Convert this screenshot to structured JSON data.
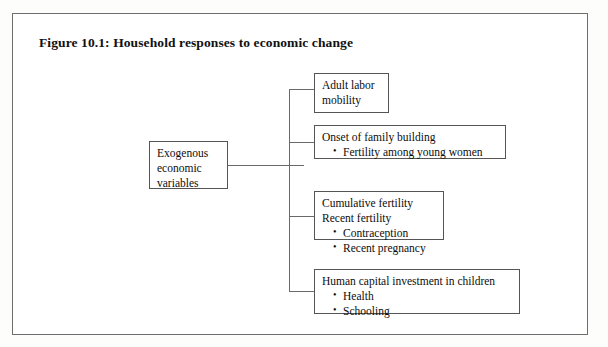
{
  "figure": {
    "title": "Figure 10.1: Household responses to economic change"
  },
  "diagram": {
    "type": "tree",
    "root": {
      "label": "Exogenous\neconomic\nvariables"
    },
    "branches": [
      {
        "id": "adult-labor-mobility",
        "head": "Adult labor\nmobility",
        "bullets": []
      },
      {
        "id": "onset-of-family-building",
        "head": "Onset of family building",
        "bullets": [
          "Fertility among young women"
        ]
      },
      {
        "id": "cumulative-and-recent-fertility",
        "head": "Cumulative fertility\nRecent fertility",
        "bullets": [
          "Contraception",
          "Recent pregnancy"
        ]
      },
      {
        "id": "human-capital-investment",
        "head": "Human capital investment in children",
        "bullets": [
          "Health",
          "Schooling"
        ]
      }
    ]
  }
}
